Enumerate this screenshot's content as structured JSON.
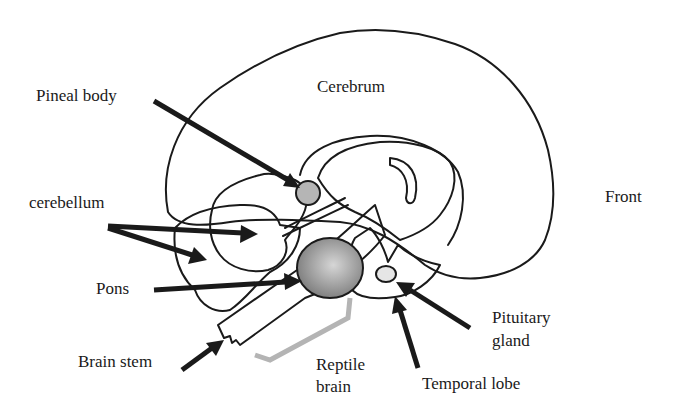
{
  "diagram": {
    "type": "labeled-anatomy-diagram",
    "labels": {
      "cerebrum": "Cerebrum",
      "pineal_body": "Pineal body",
      "cerebellum": "cerebellum",
      "front": "Front",
      "pons": "Pons",
      "brain_stem": "Brain stem",
      "reptile_brain_line1": "Reptile",
      "reptile_brain_line2": "brain",
      "pituitary_gland_line1": "Pituitary",
      "pituitary_gland_line2": "gland",
      "temporal_lobe": "Temporal lobe"
    },
    "colors": {
      "outline": "#1a1a1a",
      "background": "#ffffff",
      "cerebrum_fill": "#ffffff",
      "inner_light_fill": "#ececec",
      "cerebellum_outer_fill": "#cfcfcf",
      "pons_fill": "#8c8c8c",
      "temporal_fill": "#8a8a8a",
      "pineal_fill": "#b5b5b5",
      "pituitary_fill": "#e6e6e6",
      "reptile_bracket": "#b4b4b4"
    }
  }
}
